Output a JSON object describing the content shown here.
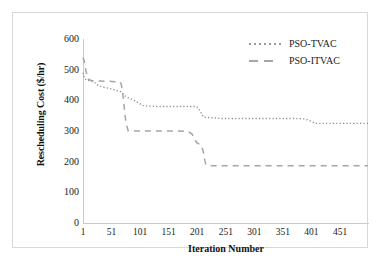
{
  "chart_data": {
    "type": "line",
    "title": "",
    "xlabel": "Iteration Number",
    "ylabel": "Rescheduling Cost ($/hr)",
    "xlim": [
      1,
      500
    ],
    "ylim": [
      0,
      600
    ],
    "xticks": [
      "1",
      "51",
      "101",
      "151",
      "201",
      "251",
      "301",
      "351",
      "401",
      "451"
    ],
    "xtick_values": [
      1,
      51,
      101,
      151,
      201,
      251,
      301,
      351,
      401,
      451
    ],
    "yticks": [
      "0",
      "100",
      "200",
      "300",
      "400",
      "500",
      "600"
    ],
    "ytick_values": [
      0,
      100,
      200,
      300,
      400,
      500,
      600
    ],
    "grid": false,
    "legend_position": "top-right",
    "series": [
      {
        "name": "PSO-TVAC",
        "style": "dotted",
        "color": "#8c8c8c",
        "x": [
          1,
          4,
          8,
          14,
          20,
          28,
          36,
          44,
          52,
          60,
          68,
          70,
          72,
          78,
          86,
          94,
          100,
          104,
          110,
          118,
          130,
          150,
          170,
          190,
          200,
          204,
          208,
          212,
          240,
          280,
          320,
          355,
          370,
          382,
          390,
          396,
          402,
          406,
          410,
          414,
          420,
          440,
          460,
          480,
          500
        ],
        "y": [
          490,
          470,
          466,
          463,
          460,
          448,
          443,
          440,
          437,
          432,
          428,
          424,
          418,
          410,
          404,
          396,
          390,
          384,
          382,
          381,
          380,
          380,
          380,
          380,
          380,
          372,
          358,
          345,
          341,
          341,
          341,
          341,
          341,
          340,
          339,
          335,
          330,
          326,
          325,
          325,
          325,
          325,
          325,
          325,
          325
        ]
      },
      {
        "name": "PSO-ITVAC",
        "style": "dashed",
        "color": "#a6a6a6",
        "x": [
          1,
          3,
          6,
          10,
          16,
          24,
          32,
          40,
          48,
          56,
          62,
          66,
          68,
          70,
          72,
          74,
          76,
          80,
          90,
          110,
          130,
          150,
          170,
          185,
          192,
          196,
          200,
          204,
          208,
          212,
          214,
          216,
          220,
          250,
          300,
          350,
          400,
          440,
          470,
          500
        ],
        "y": [
          540,
          530,
          497,
          470,
          464,
          463,
          463,
          462,
          462,
          461,
          461,
          460,
          452,
          430,
          400,
          360,
          330,
          301,
          300,
          300,
          300,
          300,
          300,
          299,
          290,
          276,
          262,
          258,
          255,
          230,
          205,
          192,
          187,
          187,
          187,
          187,
          187,
          187,
          187,
          187
        ]
      }
    ],
    "annotations": []
  },
  "legend": {
    "entries": [
      {
        "label": "PSO-TVAC",
        "marker": "dotted-line"
      },
      {
        "label": "PSO-ITVAC",
        "marker": "dashed-line"
      }
    ]
  },
  "colors": {
    "series_tvac": "#8c8c8c",
    "series_itvac": "#a6a6a6",
    "axis": "#c9c9c9",
    "frame": "#d8d8d8",
    "text": "#1a1a1a",
    "background": "#ffffff"
  }
}
